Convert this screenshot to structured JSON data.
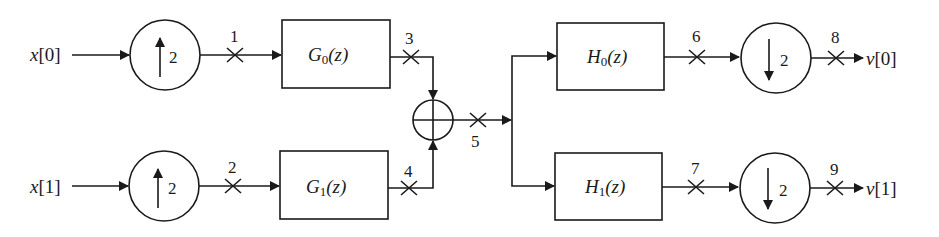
{
  "diagram": {
    "type": "two-channel multirate filter bank (synthesis followed by analysis)",
    "inputs": [
      {
        "id": "x0",
        "label_var": "x",
        "label_idx": "[0]"
      },
      {
        "id": "x1",
        "label_var": "x",
        "label_idx": "[1]"
      }
    ],
    "outputs": [
      {
        "id": "v0",
        "label_var": "v",
        "label_idx": "[0]"
      },
      {
        "id": "v1",
        "label_var": "v",
        "label_idx": "[1]"
      }
    ],
    "upsamplers": [
      {
        "id": "up0",
        "factor": "2",
        "arrow": "up"
      },
      {
        "id": "up1",
        "factor": "2",
        "arrow": "up"
      }
    ],
    "downsamplers": [
      {
        "id": "down0",
        "factor": "2",
        "arrow": "down"
      },
      {
        "id": "down1",
        "factor": "2",
        "arrow": "down"
      }
    ],
    "synthesis_filters": [
      {
        "id": "G0",
        "name": "G",
        "sub": "0",
        "arg": "(z)"
      },
      {
        "id": "G1",
        "name": "G",
        "sub": "1",
        "arg": "(z)"
      }
    ],
    "analysis_filters": [
      {
        "id": "H0",
        "name": "H",
        "sub": "0",
        "arg": "(z)"
      },
      {
        "id": "H1",
        "name": "H",
        "sub": "1",
        "arg": "(z)"
      }
    ],
    "adder": {
      "id": "sum",
      "symbol": "plus"
    },
    "test_points": [
      "1",
      "2",
      "3",
      "4",
      "5",
      "6",
      "7",
      "8",
      "9"
    ],
    "colors": {
      "stroke": "#1a1a1a",
      "background": "#ffffff"
    }
  }
}
